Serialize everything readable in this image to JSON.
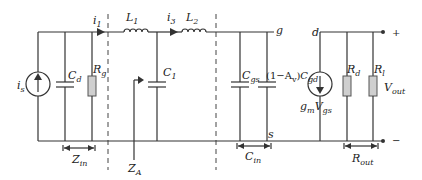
{
  "diagram": {
    "type": "small-signal equivalent circuit",
    "labels": {
      "source": "i_s",
      "cd": "C_d",
      "rg": "R_g",
      "i1": "i_1",
      "l1": "L_1",
      "c1": "C_1",
      "i3": "i_3",
      "l2": "L_2",
      "g_node": "g",
      "cgs": "C_gs",
      "miller": "(1−A_v)C_gd",
      "d_node": "d",
      "gm": "g_m V_gs",
      "rd": "R_d",
      "rl": "R_l",
      "vout": "V_out",
      "s_node": "s",
      "plus": "+",
      "minus": "−",
      "zin": "Z_in",
      "za": "Z_A",
      "cin": "C_in",
      "rout": "R_out"
    }
  }
}
